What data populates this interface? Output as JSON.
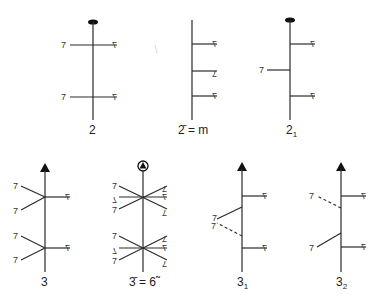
{
  "figure": {
    "colors": {
      "line": "#2a2a2a",
      "background": "#ffffff"
    },
    "motif_glyphs": {
      "right": "7",
      "left": "7",
      "flipped": "L"
    },
    "top_row": [
      {
        "id": "2",
        "label": "2",
        "axis_symbol": "ellipse"
      },
      {
        "id": "2bar",
        "label": "2̄ = m",
        "axis_symbol": "none"
      },
      {
        "id": "2_1",
        "label": "2₁",
        "axis_symbol": "ellipse"
      }
    ],
    "bottom_row": [
      {
        "id": "3",
        "label": "3",
        "axis_symbol": "triangle"
      },
      {
        "id": "3bar",
        "label": "3̄ = 6̃",
        "axis_symbol": "circled-triangle"
      },
      {
        "id": "3_1",
        "label": "3₁",
        "axis_symbol": "triangle"
      },
      {
        "id": "3_2",
        "label": "3₂",
        "axis_symbol": "triangle"
      }
    ]
  }
}
